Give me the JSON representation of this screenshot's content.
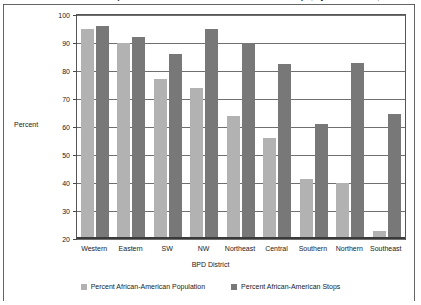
{
  "chart_data": {
    "type": "bar",
    "title": "Percent African-American Population and Percent of African-American Stops, by BPD District, 2010-2015",
    "xlabel": "BPD District",
    "ylabel": "Percent",
    "ylim": [
      20,
      100
    ],
    "yticks": [
      20,
      30,
      40,
      50,
      60,
      70,
      80,
      90,
      100
    ],
    "grid": true,
    "legend_position": "bottom",
    "categories": [
      "Western",
      "Eastern",
      "SW",
      "NW",
      "Northeast",
      "Central",
      "Southern",
      "Northern",
      "Southeast"
    ],
    "series": [
      {
        "name": "Percent African-American Population",
        "color": "#b2b2b2",
        "values": [
          95,
          90,
          77,
          74,
          64,
          56,
          41.5,
          40,
          23
        ]
      },
      {
        "name": "Percent African-American Stops",
        "color": "#787878",
        "values": [
          96,
          92,
          86,
          95,
          90,
          82.5,
          61,
          83,
          64.5
        ]
      }
    ]
  }
}
